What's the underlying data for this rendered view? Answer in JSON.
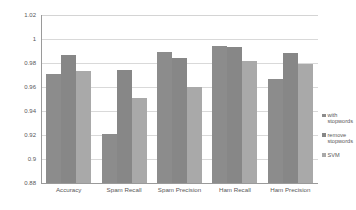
{
  "chart_data": {
    "type": "bar",
    "title": "",
    "xlabel": "",
    "ylabel": "",
    "categories": [
      "Accuracy",
      "Spam Recall",
      "Spam Precision",
      "Ham Recall",
      "Ham Precision"
    ],
    "series": [
      {
        "name": "with stopwords",
        "color": "#8c8c8c",
        "values": [
          0.971,
          0.921,
          0.989,
          0.994,
          0.967
        ]
      },
      {
        "name": "remove stopwords",
        "color": "#878787",
        "values": [
          0.987,
          0.974,
          0.984,
          0.993,
          0.988
        ]
      },
      {
        "name": "SVM",
        "color": "#a9a9a9",
        "values": [
          0.973,
          0.951,
          0.96,
          0.982,
          0.979
        ]
      }
    ],
    "ylim": [
      0.88,
      1.02
    ],
    "ytick_labels": [
      "1.02",
      "1",
      "0.98",
      "0.96",
      "0.94",
      "0.92",
      "0.9",
      "0.88"
    ],
    "ytick_values": [
      1.02,
      1.0,
      0.98,
      0.96,
      0.94,
      0.92,
      0.9,
      0.88
    ],
    "grid": true,
    "legend_position": "right"
  }
}
